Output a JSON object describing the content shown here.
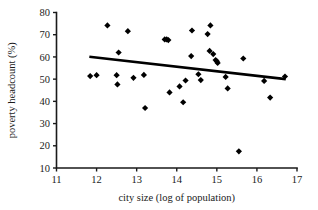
{
  "chart_data": {
    "type": "scatter",
    "title": "",
    "xlabel": "city size (log of population)",
    "ylabel": "poverty headcount (%)",
    "xlim": [
      11,
      17
    ],
    "ylim": [
      10,
      80
    ],
    "xticks": [
      11,
      12,
      13,
      14,
      15,
      16,
      17
    ],
    "yticks": [
      10,
      20,
      30,
      40,
      50,
      60,
      70,
      80
    ],
    "xtick_labels": [
      "11",
      "12",
      "13",
      "14",
      "15",
      "16",
      "17"
    ],
    "ytick_labels": [
      "10",
      "20",
      "30",
      "40",
      "50",
      "60",
      "70",
      "80"
    ],
    "grid": false,
    "legend": "none",
    "marker": "diamond",
    "marker_color": "#000000",
    "points": [
      [
        11.84,
        51.4
      ],
      [
        12.0,
        51.8
      ],
      [
        12.27,
        74.2
      ],
      [
        12.5,
        51.8
      ],
      [
        12.52,
        47.6
      ],
      [
        12.55,
        62.0
      ],
      [
        12.78,
        71.6
      ],
      [
        12.92,
        50.6
      ],
      [
        13.18,
        51.9
      ],
      [
        13.21,
        37.0
      ],
      [
        13.7,
        67.9
      ],
      [
        13.75,
        67.9
      ],
      [
        13.79,
        67.6
      ],
      [
        13.82,
        44.0
      ],
      [
        14.07,
        46.7
      ],
      [
        14.16,
        39.6
      ],
      [
        14.22,
        49.4
      ],
      [
        14.36,
        60.4
      ],
      [
        14.38,
        71.9
      ],
      [
        14.54,
        52.2
      ],
      [
        14.6,
        49.6
      ],
      [
        14.77,
        70.3
      ],
      [
        14.82,
        62.7
      ],
      [
        14.84,
        74.2
      ],
      [
        14.91,
        61.3
      ],
      [
        14.97,
        58.6
      ],
      [
        15.0,
        58.0
      ],
      [
        15.02,
        57.3
      ],
      [
        15.22,
        51.0
      ],
      [
        15.27,
        45.8
      ],
      [
        15.55,
        17.5
      ],
      [
        15.66,
        59.3
      ],
      [
        16.18,
        49.2
      ],
      [
        16.33,
        41.7
      ],
      [
        16.7,
        51.2
      ]
    ],
    "trend_line": {
      "x_start": 11.82,
      "y_start": 60.1,
      "x_end": 16.72,
      "y_end": 50.0,
      "style": "solid",
      "color": "#000000"
    }
  }
}
